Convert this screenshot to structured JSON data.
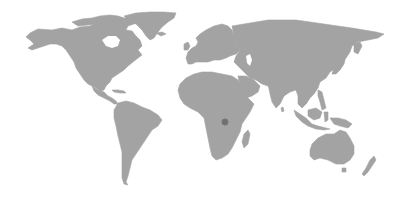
{
  "map": {
    "type": "world-map",
    "background_color": "#ffffff",
    "land_color": "#a3a3a3",
    "water_color": "#ffffff",
    "regions": [
      {
        "id": "north-america",
        "path": "M30,33 L38,29 L52,30 L62,28 L72,30 L80,27 L90,26 L98,22 L108,20 L120,19 L130,17 L140,20 L134,24 L128,26 L126,30 L132,31 L136,36 L140,40 L142,46 L138,50 L142,55 L138,58 L133,62 L128,66 L124,70 L118,74 L112,78 L110,82 L106,86 L104,90 L100,91 L96,88 L92,86 L88,84 L84,80 L80,74 L76,68 L74,62 L70,56 L66,50 L62,46 L56,44 L50,44 L44,46 L38,48 L32,50 L28,48 L34,44 L30,40 L26,37 Z"
      },
      {
        "id": "hudson-bay",
        "lake": true,
        "path": "M102,40 L108,36 L116,36 L120,40 L118,46 L112,48 L106,46 Z"
      },
      {
        "id": "canadian-arctic",
        "path": "M72,22 L82,19 L92,18 L100,16 L110,15 L118,16 L124,18 L118,21 L108,22 L98,24 L88,25 L78,26 Z"
      },
      {
        "id": "greenland",
        "path": "M124,16 L136,13 L150,12 L164,12 L176,13 L174,18 L168,22 L162,27 L158,32 L154,38 L150,40 L146,36 L142,30 L136,24 L128,20 Z"
      },
      {
        "id": "iceland",
        "path": "M156,33 L162,32 L166,34 L161,36 Z"
      },
      {
        "id": "central-america",
        "path": "M92,86 L98,90 L104,92 L108,96 L112,98 L116,101 L118,104 L114,104 L110,101 L104,98 L98,95 L94,91 Z"
      },
      {
        "id": "caribbean",
        "path": "M112,90 L118,90 L124,91 L126,93 L120,93 L114,92 Z"
      },
      {
        "id": "south-america",
        "path": "M118,103 L126,101 L134,103 L142,107 L150,110 L158,115 L162,120 L158,126 L152,130 L148,136 L144,142 L140,148 L136,154 L132,160 L130,168 L128,176 L126,182 L128,185 L124,184 L122,178 L122,170 L122,162 L122,152 L120,144 L118,136 L116,126 L114,118 L114,110 Z"
      },
      {
        "id": "europe",
        "path": "M186,58 L188,52 L192,48 L196,46 L198,42 L196,38 L200,34 L206,30 L214,26 L222,24 L228,26 L232,30 L234,36 L236,44 L240,50 L236,54 L230,56 L226,58 L220,60 L214,60 L208,62 L202,62 L196,62 L192,64 L188,64 Z"
      },
      {
        "id": "british-isles",
        "path": "M184,44 L188,42 L190,46 L188,50 L184,50 Z"
      },
      {
        "id": "asia",
        "path": "M232,26 L244,24 L256,22 L268,20 L282,20 L296,20 L310,22 L324,24 L338,26 L352,28 L364,30 L376,32 L384,34 L378,38 L368,40 L358,42 L352,46 L350,52 L346,58 L340,62 L336,68 L330,72 L326,78 L320,82 L318,88 L314,94 L310,98 L306,104 L302,100 L300,94 L296,90 L290,92 L284,96 L280,100 L276,96 L272,90 L268,86 L262,84 L256,80 L250,78 L246,74 L242,70 L238,66 L234,62 L236,56 L240,50 L236,44 L234,36 Z"
      },
      {
        "id": "caspian-sea",
        "lake": true,
        "path": "M246,56 L250,54 L252,60 L250,66 L247,63 Z"
      },
      {
        "id": "arabia",
        "path": "M238,76 L246,76 L254,80 L260,86 L258,92 L252,96 L246,98 L242,94 L240,86 Z"
      },
      {
        "id": "india",
        "path": "M268,84 L278,82 L286,84 L288,90 L284,96 L280,104 L276,108 L272,102 L270,94 Z"
      },
      {
        "id": "sri-lanka",
        "path": "M281,108 L283,107 L284,111 L282,112 Z"
      },
      {
        "id": "indochina",
        "path": "M294,86 L302,84 L308,88 L310,96 L306,104 L302,108 L298,104 L298,96 L296,90 Z"
      },
      {
        "id": "japan",
        "path": "M338,58 L342,54 L346,56 L344,64 L340,70 L336,74 L332,74 L334,68 Z"
      },
      {
        "id": "kamchatka",
        "path": "M354,44 L360,42 L362,46 L358,54 L354,52 Z"
      },
      {
        "id": "sakhalin",
        "path": "M340,48 L343,46 L344,54 L341,56 Z"
      },
      {
        "id": "taiwan-philippines",
        "path": "M318,90 L322,92 L324,100 L326,108 L322,110 L320,102 L318,96 Z"
      },
      {
        "id": "sumatra-java",
        "path": "M294,110 L300,114 L306,118 L312,124 L318,126 L326,128 L330,129 L324,130 L316,129 L308,126 L302,122 L296,116 Z"
      },
      {
        "id": "borneo",
        "path": "M308,110 L316,108 L322,112 L320,118 L314,120 L308,116 Z"
      },
      {
        "id": "sulawesi",
        "path": "M324,112 L328,112 L328,120 L325,122 Z"
      },
      {
        "id": "new-guinea",
        "path": "M330,118 L338,118 L346,120 L352,124 L348,128 L340,126 L334,124 Z"
      },
      {
        "id": "africa",
        "path": "M180,84 L186,78 L194,74 L202,72 L212,72 L222,74 L232,76 L238,80 L242,88 L246,96 L250,100 L254,104 L250,112 L246,118 L242,124 L240,132 L236,140 L232,148 L228,154 L222,158 L216,160 L212,156 L210,148 L208,138 L206,128 L204,118 L198,112 L190,108 L184,104 L180,98 L178,90 Z"
      },
      {
        "id": "madagascar",
        "path": "M244,134 L248,130 L250,134 L248,144 L244,148 L242,142 Z"
      },
      {
        "id": "australia",
        "path": "M312,144 L318,138 L326,134 L334,134 L340,130 L346,132 L350,138 L354,146 L354,154 L350,160 L344,164 L336,164 L328,160 L320,158 L314,160 L310,156 L310,150 Z"
      },
      {
        "id": "tasmania",
        "path": "M342,168 L346,168 L346,172 L342,172 Z"
      },
      {
        "id": "new-zealand",
        "path": "M370,160 L374,156 L376,160 L372,166 L368,172 L364,176 L362,174 L366,168 Z"
      }
    ],
    "markers": [
      {
        "id": "central-africa-marker",
        "label": "Central Africa",
        "cx": 225,
        "cy": 122,
        "r": 3.2,
        "color": "#6f6f6f"
      }
    ]
  }
}
